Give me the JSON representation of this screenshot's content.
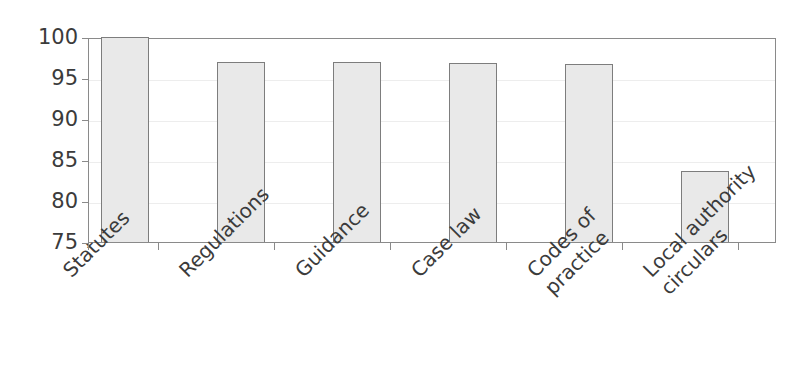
{
  "chart_data": {
    "type": "bar",
    "title": "",
    "xlabel": "",
    "ylabel": "",
    "categories": [
      "Statutes",
      "Regulations",
      "Guidance",
      "Case law",
      "Codes of practice",
      "Local authority circulars"
    ],
    "category_lines": [
      [
        "Statutes"
      ],
      [
        "Regulations"
      ],
      [
        "Guidance"
      ],
      [
        "Case law"
      ],
      [
        "Codes of",
        "practice"
      ],
      [
        "Local authority",
        "circulars"
      ]
    ],
    "values": [
      100,
      96.9,
      96.9,
      96.8,
      96.7,
      83.6
    ],
    "ylim": [
      75,
      100
    ],
    "yticks": [
      100,
      95,
      90,
      85,
      80,
      75
    ],
    "ytick_labels": [
      "100",
      "95",
      "90",
      "85",
      "80",
      "75"
    ],
    "grid": true,
    "legend": "none",
    "bar_fill_color": "#e9e9e9",
    "bar_border_color": "#7d7d7d",
    "axis_color": "#8a8a8a",
    "text_color": "#3b3b3b",
    "gridline_color": "#ededed",
    "background_color": "#ffffff"
  },
  "title_remnant": ""
}
